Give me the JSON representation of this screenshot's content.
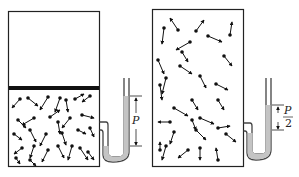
{
  "diagram": {
    "left": {
      "label": "P",
      "has_piston": true,
      "molecules": [
        [
          20,
          99,
          12,
          108
        ],
        [
          28,
          98,
          38,
          106
        ],
        [
          48,
          97,
          40,
          110
        ],
        [
          60,
          98,
          55,
          112
        ],
        [
          66,
          100,
          68,
          112
        ],
        [
          75,
          99,
          84,
          94
        ],
        [
          90,
          96,
          82,
          102
        ],
        [
          18,
          120,
          26,
          128
        ],
        [
          34,
          118,
          22,
          125
        ],
        [
          50,
          117,
          60,
          110
        ],
        [
          58,
          122,
          60,
          134
        ],
        [
          70,
          118,
          62,
          128
        ],
        [
          82,
          115,
          94,
          118
        ],
        [
          14,
          134,
          22,
          140
        ],
        [
          30,
          130,
          36,
          142
        ],
        [
          46,
          134,
          40,
          146
        ],
        [
          62,
          133,
          66,
          145
        ],
        [
          78,
          130,
          86,
          134
        ],
        [
          90,
          128,
          94,
          137
        ],
        [
          22,
          148,
          14,
          154
        ],
        [
          34,
          146,
          30,
          158
        ],
        [
          48,
          150,
          42,
          162
        ],
        [
          58,
          146,
          64,
          158
        ],
        [
          72,
          146,
          68,
          160
        ],
        [
          80,
          148,
          88,
          160
        ],
        [
          30,
          160,
          36,
          166
        ],
        [
          16,
          158,
          20,
          164
        ],
        [
          88,
          152,
          94,
          160
        ]
      ]
    },
    "right": {
      "label_num": "P",
      "label_den": "2",
      "has_piston": false,
      "molecules": [
        [
          178,
          30,
          170,
          18
        ],
        [
          196,
          31,
          204,
          20
        ],
        [
          230,
          35,
          232,
          22
        ],
        [
          164,
          28,
          162,
          44
        ],
        [
          190,
          42,
          176,
          50
        ],
        [
          208,
          36,
          222,
          42
        ],
        [
          158,
          60,
          164,
          74
        ],
        [
          182,
          52,
          188,
          62
        ],
        [
          224,
          56,
          232,
          66
        ],
        [
          180,
          66,
          192,
          74
        ],
        [
          200,
          76,
          206,
          88
        ],
        [
          166,
          78,
          162,
          94
        ],
        [
          160,
          85,
          162,
          100
        ],
        [
          216,
          84,
          228,
          90
        ],
        [
          192,
          100,
          198,
          110
        ],
        [
          218,
          100,
          224,
          110
        ],
        [
          174,
          108,
          188,
          116
        ],
        [
          200,
          118,
          214,
          124
        ],
        [
          170,
          122,
          158,
          122
        ],
        [
          192,
          120,
          196,
          130
        ],
        [
          218,
          128,
          230,
          126
        ],
        [
          174,
          132,
          170,
          144
        ],
        [
          196,
          130,
          206,
          140
        ],
        [
          226,
          134,
          236,
          142
        ],
        [
          166,
          146,
          162,
          160
        ],
        [
          188,
          150,
          178,
          158
        ],
        [
          200,
          148,
          200,
          160
        ],
        [
          218,
          160,
          216,
          148
        ],
        [
          160,
          150,
          160,
          142
        ]
      ]
    }
  }
}
